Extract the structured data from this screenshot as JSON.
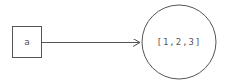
{
  "diagram": {
    "variable": {
      "name": "a"
    },
    "object": {
      "value": "[1,2,3]"
    },
    "edge": {
      "from": "a",
      "to": "[1,2,3]",
      "type": "reference-arrow"
    },
    "colors": {
      "stroke": "#555555",
      "background": "#ffffff"
    }
  }
}
